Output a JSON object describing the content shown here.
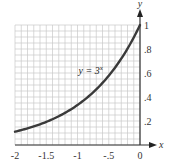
{
  "chart_data": {
    "type": "line",
    "title": "",
    "xlabel": "x",
    "ylabel": "y",
    "xlim": [
      -2,
      0
    ],
    "ylim": [
      0,
      1
    ],
    "grid": true,
    "grid_x_step": 0.1,
    "grid_y_step": 0.05,
    "x_ticks": [
      {
        "value": -2,
        "label": "-2"
      },
      {
        "value": -1.5,
        "label": "-1.5"
      },
      {
        "value": -1,
        "label": "-1"
      },
      {
        "value": -0.5,
        "label": "-.5"
      },
      {
        "value": 0,
        "label": "0"
      }
    ],
    "y_ticks": [
      {
        "value": 0.2,
        "label": ".2"
      },
      {
        "value": 0.4,
        "label": ".4"
      },
      {
        "value": 0.6,
        "label": ".6"
      },
      {
        "value": 0.8,
        "label": ".8"
      },
      {
        "value": 1,
        "label": "1"
      }
    ],
    "series": [
      {
        "name": "y = 3^x",
        "function": "3^x",
        "x": [
          -2,
          -1.75,
          -1.5,
          -1.25,
          -1,
          -0.75,
          -0.5,
          -0.25,
          0
        ],
        "y": [
          0.111,
          0.146,
          0.192,
          0.253,
          0.333,
          0.439,
          0.577,
          0.76,
          1.0
        ]
      }
    ],
    "annotations": [
      {
        "text": "y = 3",
        "superscript": "x",
        "x": -0.92,
        "y": 0.6
      }
    ],
    "colors": {
      "curve": "#3a3a3a",
      "grid": "#c8c8c8",
      "axis": "#333333"
    }
  }
}
